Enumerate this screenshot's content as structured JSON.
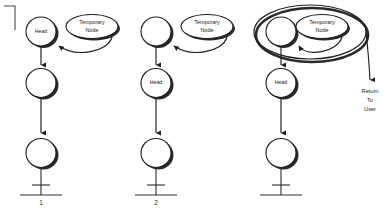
{
  "diagram": {
    "background_color": "#ffffff",
    "stroke_color": "#1f1f1f",
    "shadow_color": "#2a2a2a",
    "stages": [
      {
        "number_label": "1",
        "nodes": [
          {
            "label": "Head"
          },
          {
            "label": ""
          },
          {
            "label": ""
          }
        ],
        "temporary_node_label_line1": "Temporary",
        "temporary_node_label_line2": "Node",
        "has_enclosing_ring": false,
        "has_return_arrow": false
      },
      {
        "number_label": "2",
        "nodes": [
          {
            "label": ""
          },
          {
            "label": "Head"
          },
          {
            "label": ""
          }
        ],
        "temporary_node_label_line1": "Temporary",
        "temporary_node_label_line2": "Node",
        "has_enclosing_ring": false,
        "has_return_arrow": false
      },
      {
        "number_label": "",
        "nodes": [
          {
            "label": ""
          },
          {
            "label": "Head"
          },
          {
            "label": ""
          }
        ],
        "temporary_node_label_line1": "Temporary",
        "temporary_node_label_line2": "Node",
        "has_enclosing_ring": true,
        "has_return_arrow": true,
        "return_label_line1": "Return",
        "return_label_line2": "To",
        "return_label_line3": "User"
      }
    ]
  }
}
